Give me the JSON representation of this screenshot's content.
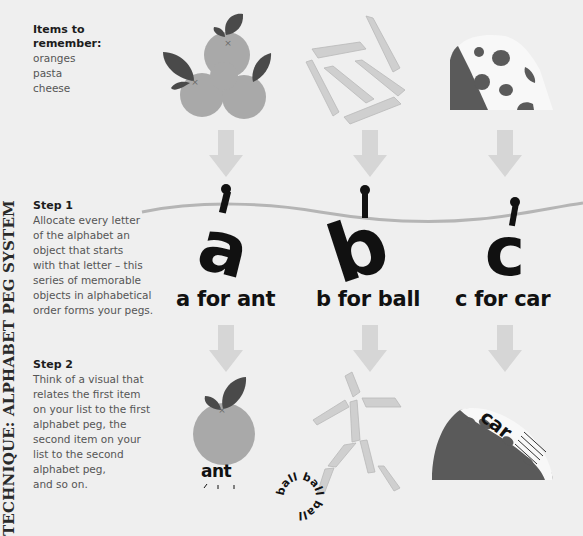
{
  "side_title": "TECHNIQUE: ALPHABET PEG SYSTEM",
  "items": {
    "heading": "Items to remember:",
    "list": [
      "oranges",
      "pasta",
      "cheese"
    ]
  },
  "step1": {
    "heading": "Step 1",
    "lines": [
      "Allocate every letter",
      "of the alphabet an",
      "object that starts",
      "with that letter – this",
      "series of memorable",
      "objects in alphabetical",
      "order forms your pegs."
    ]
  },
  "step2": {
    "heading": "Step 2",
    "lines": [
      "Think of a visual that",
      "relates the first item",
      "on your list to the first",
      "alphabet peg, the",
      "second item on your",
      "list to the second",
      "alphabet peg,",
      "and so on."
    ]
  },
  "pegs": [
    {
      "letter": "a",
      "caption": "a for ant",
      "word": "ant"
    },
    {
      "letter": "b",
      "caption": "b for ball",
      "word": "ball"
    },
    {
      "letter": "c",
      "caption": "c for car",
      "word": "car"
    }
  ],
  "colors": {
    "background": "#efefef",
    "orange": "#a9a9a9",
    "leaf": "#4a4a4a",
    "pasta": "#cfcfcf",
    "cheese_dark": "#5a5a5a",
    "cheese_light": "#f8f8f8",
    "arrow": "#d6d6d6",
    "line": "#b5b5b5",
    "ink": "#111111"
  }
}
